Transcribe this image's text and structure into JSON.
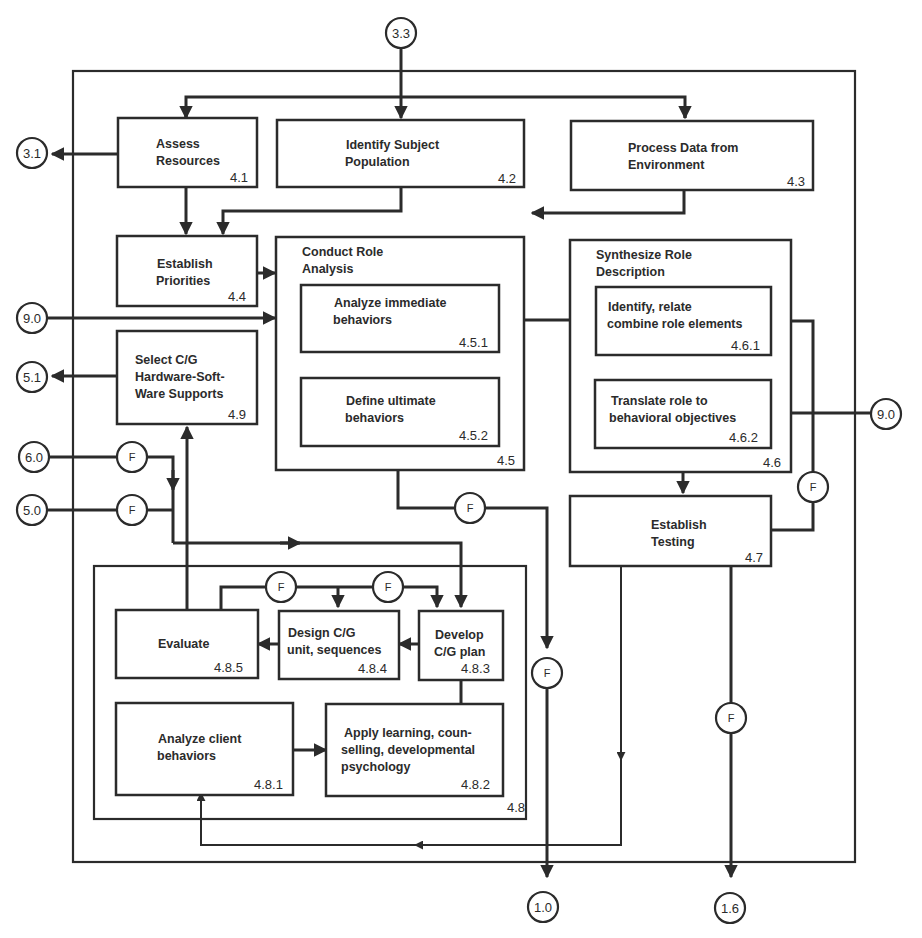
{
  "diagram": {
    "connectors": {
      "c33": "3.3",
      "c31": "3.1",
      "c90_left": "9.0",
      "c51": "5.1",
      "c60": "6.0",
      "c50": "5.0",
      "c90_right": "9.0",
      "c10": "1.0",
      "c16": "1.6"
    },
    "feedback_label": "F",
    "nodes": {
      "n41": {
        "line1": "Assess",
        "line2": "Resources",
        "num": "4.1"
      },
      "n42": {
        "line1": "Identify Subject",
        "line2": "Population",
        "num": "4.2"
      },
      "n43": {
        "line1": "Process Data from",
        "line2": "Environment",
        "num": "4.3"
      },
      "n44": {
        "line1": "Establish",
        "line2": "Priorities",
        "num": "4.4"
      },
      "n45": {
        "line1": "Conduct Role",
        "line2": "Analysis",
        "num": "4.5"
      },
      "n451": {
        "line1": "Analyze immediate",
        "line2": "behaviors",
        "num": "4.5.1"
      },
      "n452": {
        "line1": "Define ultimate",
        "line2": "behaviors",
        "num": "4.5.2"
      },
      "n46": {
        "line1": "Synthesize Role",
        "line2": "Description",
        "num": "4.6"
      },
      "n461": {
        "line1": "Identify, relate",
        "line2": "combine role elements",
        "num": "4.6.1"
      },
      "n462": {
        "line1": "Translate role to",
        "line2": "behavioral objectives",
        "num": "4.6.2"
      },
      "n47": {
        "line1": "Establish",
        "line2": "Testing",
        "num": "4.7"
      },
      "n48": {
        "num": "4.8"
      },
      "n481": {
        "line1": "Analyze client",
        "line2": "behaviors",
        "num": "4.8.1"
      },
      "n482": {
        "line1": "Apply learning, coun-",
        "line2": "selling, developmental",
        "line3": "psychology",
        "num": "4.8.2"
      },
      "n483": {
        "line1": "Develop",
        "line2": "C/G plan",
        "num": "4.8.3"
      },
      "n484": {
        "line1": "Design C/G",
        "line2": "unit, sequences",
        "num": "4.8.4"
      },
      "n485": {
        "line1": "Evaluate",
        "num": "4.8.5"
      },
      "n49": {
        "line1": "Select C/G",
        "line2": "Hardware-Soft-",
        "line3": "Ware Supports",
        "num": "4.9"
      }
    }
  }
}
